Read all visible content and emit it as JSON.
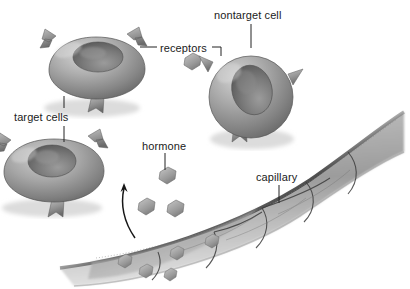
{
  "figure": {
    "type": "biological-illustration",
    "style": "grayscale airbrush rendering",
    "background_color": "#ffffff"
  },
  "labels": {
    "nontarget_cell": "nontarget cell",
    "receptors": "receptors",
    "target_cells": "target cells",
    "hormone": "hormone",
    "capillary": "capillary"
  },
  "palette": {
    "ink": "#1b1b1b",
    "leader_line": "#2a2a2a",
    "cell_light": "#c9c9c9",
    "cell_mid": "#9a9a9a",
    "cell_dark": "#6a6a6a",
    "cell_edge": "#4a4a4a",
    "nucleus_dark": "#5d5d5d",
    "nucleus_light": "#8f8f8f",
    "receptor_light": "#b4b4b4",
    "receptor_dark": "#6d6d6d",
    "hormone_light": "#b8b8b8",
    "hormone_dark": "#7b7b7b",
    "capillary_light": "#d2d2d2",
    "capillary_mid": "#a2a2a2",
    "capillary_dark": "#5a5a5a",
    "junction": "#3a3a3a",
    "shadow": "#d8d8d8"
  },
  "structures": {
    "target_cells": {
      "count": 2,
      "description": "Flattened disc-shaped cells with sunken nucleus, each bearing three notched receptor knobs",
      "receptors_per_cell": 3,
      "receptor_shape": "notched block (binding socket)"
    },
    "nontarget_cell": {
      "count": 1,
      "description": "Rounder cell with three pointed conical spikes instead of matching receptors",
      "spikes": 3,
      "spike_shape": "tapered cone"
    },
    "hormone_molecules": {
      "free_in_tissue": 4,
      "inside_capillary": 5,
      "shape": "irregular pentagon blob"
    },
    "capillary": {
      "description": "Curved vessel crossing the lower right, built from polygonal endothelial cells with dark junctions",
      "endothelial_cells": 7
    },
    "release_arrow": {
      "description": "Curved arrow from the capillary upward-left showing hormone release into tissue"
    }
  }
}
